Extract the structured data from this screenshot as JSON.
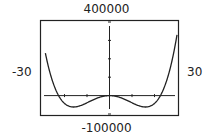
{
  "chart_data": {
    "type": "line",
    "title": "",
    "xlabel": "",
    "ylabel": "",
    "xlim": [
      -30,
      30
    ],
    "ylim": [
      -100000,
      400000
    ],
    "window_labels": {
      "xmin": "-30",
      "xmax": "30",
      "ymin": "-100000",
      "ymax": "400000"
    },
    "grid": false,
    "ticks": {
      "x_step": 10,
      "y_step": 100000
    },
    "series": [
      {
        "name": "f(x)",
        "description": "Quartic W-shaped curve: local max at origin (0,0), two local minima near x=±16 (y≈-60000), x-intercepts near x=±22",
        "x": [
          -28,
          -24,
          -22,
          -20,
          -16,
          -12,
          -8,
          -4,
          0,
          4,
          8,
          12,
          16,
          20,
          22,
          24,
          28,
          30
        ],
        "y": [
          255000,
          60000,
          0,
          -40000,
          -62000,
          -48000,
          -24000,
          -7000,
          0,
          -7000,
          -24000,
          -48000,
          -62000,
          -40000,
          0,
          60000,
          255000,
          390000
        ]
      }
    ]
  }
}
